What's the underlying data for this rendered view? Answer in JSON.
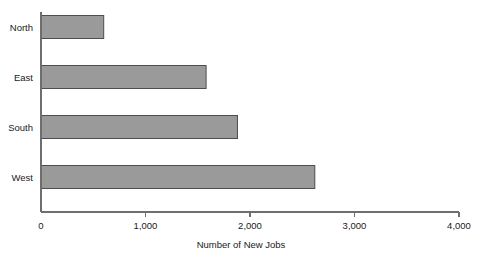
{
  "chart_data": {
    "type": "bar",
    "orientation": "horizontal",
    "title": "",
    "xlabel": "Number of New Jobs",
    "ylabel": "",
    "categories": [
      "North",
      "East",
      "South",
      "West"
    ],
    "values": [
      600,
      1580,
      1880,
      2620
    ],
    "xlim": [
      0,
      4000
    ],
    "xticks": [
      0,
      1000,
      2000,
      3000,
      4000
    ],
    "xtick_labels": [
      "0",
      "1,000",
      "2,000",
      "3,000",
      "4,000"
    ],
    "grid": false,
    "legend": false,
    "bar_color": "#9a9a9a",
    "bar_edge_color": "#4d4d4d",
    "axis_color": "#6e6e6e",
    "text_color": "#1a1a1a",
    "background": "#ffffff"
  }
}
